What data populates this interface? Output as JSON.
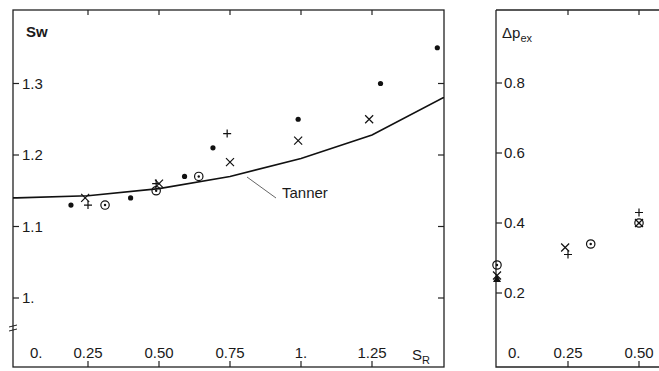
{
  "chart_data": [
    {
      "type": "scatter",
      "title": "",
      "ylabel": "Sw",
      "xlabel": "S_R",
      "xlim": [
        0,
        1.5
      ],
      "ylim": [
        0.96,
        1.4
      ],
      "x_ticks": [
        "0.",
        "0.25",
        "0.50",
        "0.75",
        "1.",
        "1.25"
      ],
      "y_ticks": [
        "1.",
        "1.1",
        "1.2",
        "1.3"
      ],
      "grid": false,
      "axis_break_marker": true,
      "annotations": [
        {
          "text": "Tanner",
          "points_to": "curve"
        }
      ],
      "series": [
        {
          "name": "filled-dot",
          "marker": "dot",
          "x": [
            0.19,
            0.4,
            0.59,
            0.69,
            0.99,
            1.28,
            1.48
          ],
          "y": [
            1.13,
            1.14,
            1.17,
            1.21,
            1.25,
            1.3,
            1.35
          ]
        },
        {
          "name": "cross",
          "marker": "x",
          "x": [
            0.24,
            0.5,
            0.75,
            0.99,
            1.24
          ],
          "y": [
            1.14,
            1.16,
            1.19,
            1.22,
            1.25
          ]
        },
        {
          "name": "plus",
          "marker": "plus",
          "x": [
            0.25,
            0.49,
            0.74
          ],
          "y": [
            1.13,
            1.16,
            1.23
          ]
        },
        {
          "name": "circled-dot",
          "marker": "circle-dot",
          "x": [
            0.31,
            0.49,
            0.64
          ],
          "y": [
            1.13,
            1.15,
            1.17
          ]
        },
        {
          "name": "Tanner",
          "marker": "line",
          "x": [
            0,
            0.25,
            0.5,
            0.75,
            1.0,
            1.25,
            1.5
          ],
          "y": [
            1.14,
            1.143,
            1.153,
            1.17,
            1.195,
            1.228,
            1.28
          ]
        }
      ]
    },
    {
      "type": "scatter",
      "title": "",
      "ylabel": "Δp_ex",
      "xlabel": "",
      "xlim": [
        0,
        0.57
      ],
      "ylim": [
        0.12,
        0.9
      ],
      "x_ticks": [
        "0.",
        "0.25",
        "0.50"
      ],
      "y_ticks": [
        "0.2",
        "0.4",
        "0.6",
        "0.8"
      ],
      "grid": false,
      "series": [
        {
          "name": "circled-dot",
          "marker": "circle-dot",
          "x": [
            0.0,
            0.33,
            0.5
          ],
          "y": [
            0.28,
            0.34,
            0.4
          ]
        },
        {
          "name": "cross",
          "marker": "x",
          "x": [
            0.0,
            0.24,
            0.5
          ],
          "y": [
            0.25,
            0.33,
            0.4
          ]
        },
        {
          "name": "plus",
          "marker": "plus",
          "x": [
            0.25,
            0.5
          ],
          "y": [
            0.31,
            0.43
          ]
        },
        {
          "name": "filled-triangle",
          "marker": "triangle",
          "x": [
            0.0
          ],
          "y": [
            0.24
          ]
        }
      ]
    }
  ],
  "left": {
    "ylabel": "Sw",
    "xlabel_main": "S",
    "xlabel_sub": "R",
    "annotation": "Tanner",
    "x_ticks": [
      "0.",
      "0.25",
      "0.50",
      "0.75",
      "1.",
      "1.25"
    ],
    "y_ticks": [
      "1.3",
      "1.2",
      "1.1",
      "1."
    ]
  },
  "right": {
    "ylabel_main": "Δp",
    "ylabel_sub": "ex",
    "x_ticks": [
      "0.",
      "0.25",
      "0.50"
    ],
    "y_ticks": [
      "0.8",
      "0.6",
      "0.4",
      "0.2"
    ]
  }
}
